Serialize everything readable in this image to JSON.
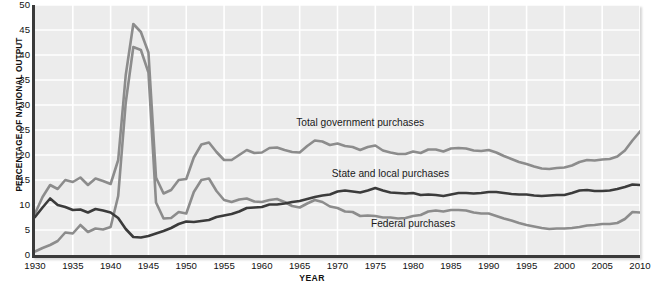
{
  "chart_data": {
    "type": "line",
    "title": "",
    "xlabel": "YEAR",
    "ylabel": "PERCENTAGE OF NATIONAL OUTPUT",
    "xlim": [
      1930,
      2010
    ],
    "ylim": [
      0,
      50
    ],
    "grid": true,
    "legend_position": "in-plot annotations",
    "yticks": [
      0,
      5,
      10,
      15,
      20,
      25,
      30,
      35,
      40,
      45,
      50
    ],
    "xticks": [
      1930,
      1935,
      1940,
      1945,
      1950,
      1955,
      1960,
      1965,
      1970,
      1975,
      1980,
      1985,
      1990,
      1995,
      2000,
      2005,
      2010
    ],
    "x": [
      1930,
      1931,
      1932,
      1933,
      1934,
      1935,
      1936,
      1937,
      1938,
      1939,
      1940,
      1941,
      1942,
      1943,
      1944,
      1945,
      1946,
      1947,
      1948,
      1949,
      1950,
      1951,
      1952,
      1953,
      1954,
      1955,
      1956,
      1957,
      1958,
      1959,
      1960,
      1961,
      1962,
      1963,
      1964,
      1965,
      1966,
      1967,
      1968,
      1969,
      1970,
      1971,
      1972,
      1973,
      1974,
      1975,
      1976,
      1977,
      1978,
      1979,
      1980,
      1981,
      1982,
      1983,
      1984,
      1985,
      1986,
      1987,
      1988,
      1989,
      1990,
      1991,
      1992,
      1993,
      1994,
      1995,
      1996,
      1997,
      1998,
      1999,
      2000,
      2001,
      2002,
      2003,
      2004,
      2005,
      2006,
      2007,
      2008,
      2009,
      2010
    ],
    "series": [
      {
        "name": "Total government purchases",
        "color": "#8c8c8c",
        "values": [
          8.3,
          11.6,
          14.0,
          13.2,
          15.0,
          14.6,
          15.5,
          14.0,
          15.3,
          14.8,
          14.2,
          19.0,
          36.0,
          46.2,
          44.6,
          40.5,
          15.5,
          12.3,
          13.0,
          15.0,
          15.2,
          19.5,
          22.1,
          22.5,
          20.6,
          19.0,
          19.0,
          20.0,
          21.0,
          20.4,
          20.5,
          21.4,
          21.5,
          21.0,
          20.6,
          20.5,
          21.8,
          22.9,
          22.7,
          22.0,
          22.3,
          21.8,
          21.6,
          21.0,
          21.6,
          21.9,
          20.9,
          20.5,
          20.2,
          20.2,
          20.7,
          20.4,
          21.1,
          21.1,
          20.7,
          21.3,
          21.4,
          21.3,
          20.9,
          20.8,
          21.0,
          20.5,
          19.8,
          19.2,
          18.6,
          18.2,
          17.7,
          17.3,
          17.2,
          17.4,
          17.5,
          17.9,
          18.6,
          19.0,
          18.9,
          19.1,
          19.2,
          19.7,
          20.9,
          22.9,
          24.7
        ]
      },
      {
        "name": "State and local purchases",
        "color": "#3b3b3b",
        "values": [
          7.6,
          9.5,
          11.3,
          10.0,
          9.6,
          9.0,
          9.1,
          8.5,
          9.2,
          8.9,
          8.5,
          7.4,
          5.2,
          3.6,
          3.5,
          3.8,
          4.3,
          4.8,
          5.4,
          6.2,
          6.7,
          6.6,
          6.8,
          7.0,
          7.6,
          7.9,
          8.2,
          8.7,
          9.4,
          9.5,
          9.6,
          10.1,
          10.1,
          10.3,
          10.6,
          10.8,
          11.2,
          11.6,
          11.9,
          12.1,
          12.7,
          12.9,
          12.7,
          12.5,
          12.9,
          13.4,
          12.9,
          12.5,
          12.4,
          12.3,
          12.4,
          12.0,
          12.1,
          12.0,
          11.8,
          12.1,
          12.4,
          12.4,
          12.3,
          12.4,
          12.6,
          12.6,
          12.4,
          12.2,
          12.1,
          12.1,
          11.9,
          11.8,
          11.9,
          12.0,
          12.0,
          12.4,
          12.9,
          13.0,
          12.8,
          12.8,
          12.9,
          13.2,
          13.6,
          14.1,
          14.0
        ]
      },
      {
        "name": "Federal purchases",
        "color": "#8c8c8c",
        "values": [
          0.7,
          1.4,
          2.0,
          2.8,
          4.5,
          4.3,
          6.0,
          4.6,
          5.3,
          5.1,
          5.6,
          11.8,
          30.5,
          41.6,
          41.0,
          36.5,
          10.5,
          7.3,
          7.4,
          8.6,
          8.3,
          12.6,
          15.0,
          15.3,
          12.8,
          11.0,
          10.6,
          11.1,
          11.3,
          10.7,
          10.6,
          11.0,
          11.2,
          10.6,
          9.8,
          9.5,
          10.3,
          11.0,
          10.6,
          9.7,
          9.4,
          8.7,
          8.6,
          7.8,
          7.9,
          7.8,
          7.5,
          7.5,
          7.3,
          7.4,
          7.8,
          8.0,
          8.7,
          8.9,
          8.7,
          9.0,
          9.0,
          8.9,
          8.5,
          8.3,
          8.3,
          7.8,
          7.3,
          6.9,
          6.4,
          6.0,
          5.7,
          5.4,
          5.2,
          5.3,
          5.3,
          5.4,
          5.6,
          5.9,
          6.0,
          6.2,
          6.2,
          6.4,
          7.2,
          8.6,
          8.5
        ]
      }
    ],
    "annotations": [
      {
        "id": "total-label",
        "text": "Total government purchases",
        "x": 1973,
        "y": 26.5
      },
      {
        "id": "state-label",
        "text": "State and local purchases",
        "x": 1977,
        "y": 16.3
      },
      {
        "id": "federal-label",
        "text": "Federal purchases",
        "x": 1980,
        "y": 6.3
      }
    ]
  },
  "axes": {
    "ylabel": "PERCENTAGE OF NATIONAL OUTPUT",
    "xlabel": "YEAR"
  },
  "colors": {
    "plot_background": "#ececec",
    "gridline": "#ffffff",
    "axis": "#3a3a3a",
    "total_series": "#8c8c8c",
    "state_local_series": "#3b3b3b",
    "federal_series": "#8c8c8c",
    "text": "#111111"
  }
}
